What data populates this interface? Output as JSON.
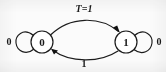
{
  "figure": {
    "type": "state-transition-diagram",
    "title": "",
    "background_color": "#fbfbfb",
    "ink_color": "#1c1c1c"
  },
  "states": [
    {
      "id": "s0",
      "label": "0",
      "cx": 42,
      "cy": 42,
      "r": 11
    },
    {
      "id": "s1",
      "label": "1",
      "cx": 126,
      "cy": 42,
      "r": 11
    }
  ],
  "transitions": [
    {
      "id": "t-self-0",
      "from": "s0",
      "to": "s0",
      "label": "0",
      "label_x": 9,
      "label_y": 42,
      "kind": "self-loop-left"
    },
    {
      "id": "t-0-to-1",
      "from": "s0",
      "to": "s1",
      "label": "T=1",
      "label_x": 84,
      "label_y": 10,
      "kind": "upper-arc"
    },
    {
      "id": "t-1-to-0",
      "from": "s1",
      "to": "s0",
      "label": "1",
      "label_x": 84,
      "label_y": 65,
      "kind": "lower-arc"
    },
    {
      "id": "t-self-1",
      "from": "s1",
      "to": "s1",
      "label": "0",
      "label_x": 159,
      "label_y": 42,
      "kind": "self-loop-right"
    }
  ]
}
